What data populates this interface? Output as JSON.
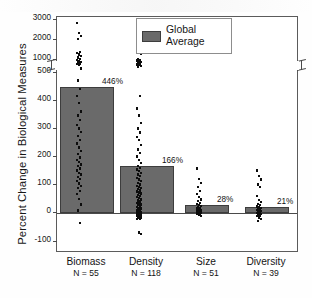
{
  "chart_data": {
    "type": "bar",
    "title": "",
    "xlabel": "",
    "ylabel": "Percent Change in Biological Measures",
    "categories": [
      "Biomass",
      "Density",
      "Size",
      "Diversity"
    ],
    "values": [
      446,
      166,
      28,
      21
    ],
    "value_labels": [
      "446%",
      "166%",
      "28%",
      "21%"
    ],
    "sample_sizes": [
      "N = 55",
      "N = 118",
      "N = 51",
      "N = 39"
    ],
    "series": [
      {
        "name": "Global Average",
        "values": [
          446,
          166,
          28,
          21
        ]
      }
    ],
    "legend": {
      "position": "top-right",
      "entries": [
        "Global Average"
      ]
    },
    "grid": false,
    "axis_break": {
      "between": [
        500,
        1000
      ],
      "present": true
    },
    "ylim": [
      -100,
      3000
    ],
    "yticks_lower": [
      -100,
      0,
      100,
      200,
      300,
      400,
      500
    ],
    "yticks_upper": [
      1000,
      2000,
      3000
    ],
    "ytick_labels": [
      "-100",
      "0",
      "100",
      "200",
      "300",
      "400",
      "500",
      "1000",
      "2000",
      "3000"
    ],
    "bar_color": "#6a6a6a",
    "point_color": "#0d0d0d",
    "points": {
      "Biomass": [
        2800,
        2300,
        2150,
        2000,
        1350,
        1300,
        1220,
        1150,
        1080,
        1010,
        960,
        900,
        860,
        820,
        780,
        740,
        700,
        520,
        470,
        440,
        415,
        390,
        360,
        345,
        330,
        312,
        300,
        288,
        272,
        258,
        246,
        232,
        220,
        208,
        196,
        188,
        180,
        172,
        166,
        158,
        150,
        142,
        136,
        128,
        120,
        112,
        104,
        96,
        88,
        78,
        66,
        50,
        30,
        8,
        -35
      ],
      "Density": [
        2220,
        1320,
        1240,
        1000,
        960,
        920,
        880,
        840,
        800,
        760,
        730,
        700,
        660,
        630,
        415,
        370,
        345,
        320,
        300,
        285,
        270,
        258,
        240,
        225,
        212,
        200,
        188,
        176,
        166,
        160,
        154,
        148,
        142,
        136,
        130,
        124,
        118,
        112,
        106,
        100,
        96,
        92,
        88,
        84,
        80,
        76,
        72,
        68,
        64,
        60,
        56,
        52,
        48,
        44,
        40,
        36,
        33,
        30,
        27,
        24,
        21,
        18,
        15,
        12,
        10,
        8,
        6,
        4,
        2,
        0,
        -2,
        -4,
        -6,
        -8,
        -10,
        -12,
        -14,
        -16,
        -18,
        -20,
        -22,
        -70,
        -75
      ],
      "Size": [
        158,
        120,
        106,
        92,
        78,
        66,
        56,
        48,
        42,
        36,
        31,
        27,
        24,
        21,
        18,
        15,
        13,
        11,
        9,
        7,
        5,
        3,
        1,
        -1,
        -3,
        -5,
        -8,
        -12
      ],
      "Diversity": [
        150,
        130,
        118,
        100,
        92,
        60,
        46,
        38,
        32,
        27,
        23,
        20,
        17,
        14,
        12,
        10,
        8,
        6,
        4,
        2,
        0,
        -2,
        -4,
        -6,
        -9,
        -12,
        -16,
        -22,
        -30
      ]
    }
  },
  "legend": {
    "label_line1": "Global",
    "label_line2": "Average"
  },
  "axis": {
    "ylabel": "Percent Change in Biological Measures",
    "tick_3000": "3000",
    "tick_2000": "2000",
    "tick_1000": "1000",
    "tick_500": "500",
    "tick_400": "400",
    "tick_300": "300",
    "tick_200": "200",
    "tick_100": "100",
    "tick_0": "0",
    "tick_neg100": "-100"
  },
  "categories": [
    {
      "name": "Biomass",
      "n": "N = 55",
      "value_label": "446%"
    },
    {
      "name": "Density",
      "n": "N = 118",
      "value_label": "166%"
    },
    {
      "name": "Size",
      "n": "N = 51",
      "value_label": "28%"
    },
    {
      "name": "Diversity",
      "n": "N = 39",
      "value_label": "21%"
    }
  ]
}
